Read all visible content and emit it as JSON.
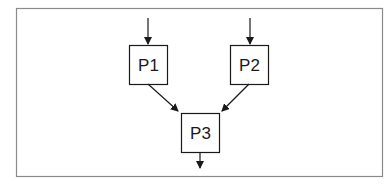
{
  "diagram": {
    "frame": {
      "x": 16,
      "y": 8,
      "width": 366,
      "height": 168,
      "stroke": "#8a8a8a"
    },
    "nodes": [
      {
        "id": "P1",
        "label": "P1",
        "x": 129,
        "y": 45,
        "width": 38,
        "height": 39
      },
      {
        "id": "P2",
        "label": "P2",
        "x": 230,
        "y": 45,
        "width": 38,
        "height": 39
      },
      {
        "id": "P3",
        "label": "P3",
        "x": 181,
        "y": 113,
        "width": 38,
        "height": 39
      }
    ],
    "edges": [
      {
        "from": "input",
        "to": "P1"
      },
      {
        "from": "input",
        "to": "P2"
      },
      {
        "from": "P1",
        "to": "P3"
      },
      {
        "from": "P2",
        "to": "P3"
      },
      {
        "from": "P3",
        "to": "output"
      }
    ],
    "stroke_color": "#1a1a1a"
  }
}
